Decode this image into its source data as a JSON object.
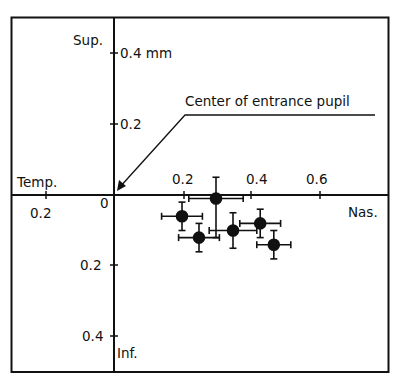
{
  "chart_data": {
    "type": "scatter",
    "title": "",
    "xlabel": "Temp. / Nas.",
    "ylabel": "Sup. / Inf.",
    "units": "mm",
    "x_axis": {
      "negative_label": "Temp.",
      "positive_label": "Nas.",
      "ticks": [
        {
          "value": -0.2,
          "label": "0.2"
        },
        {
          "value": 0.0,
          "label": "0"
        },
        {
          "value": 0.2,
          "label": "0.2"
        },
        {
          "value": 0.4,
          "label": "0.4"
        },
        {
          "value": 0.6,
          "label": "0.6"
        }
      ],
      "range": [
        -0.3,
        0.81
      ]
    },
    "y_axis": {
      "positive_label": "Sup.",
      "negative_label": "Inf.",
      "ticks": [
        {
          "value": 0.4,
          "label": "0.4 mm"
        },
        {
          "value": 0.2,
          "label": "0.2"
        },
        {
          "value": -0.2,
          "label": "0.2"
        },
        {
          "value": -0.4,
          "label": "0.4"
        }
      ],
      "range": [
        -0.5,
        0.5
      ]
    },
    "annotation": {
      "text": "Center of entrance pupil",
      "points_to": [
        0,
        0
      ]
    },
    "grid": false,
    "legend": null,
    "series": [
      {
        "name": "measurements",
        "marker": "filled-circle",
        "points": [
          {
            "x": 0.3,
            "y": -0.01,
            "x_err": [
              0.22,
              0.38
            ],
            "y_err": [
              -0.12,
              0.05
            ]
          },
          {
            "x": 0.2,
            "y": -0.06,
            "x_err": [
              0.14,
              0.26
            ],
            "y_err": [
              -0.1,
              -0.02
            ]
          },
          {
            "x": 0.25,
            "y": -0.12,
            "x_err": [
              0.19,
              0.31
            ],
            "y_err": [
              -0.16,
              -0.08
            ]
          },
          {
            "x": 0.35,
            "y": -0.1,
            "x_err": [
              0.28,
              0.42
            ],
            "y_err": [
              -0.15,
              -0.05
            ]
          },
          {
            "x": 0.43,
            "y": -0.08,
            "x_err": [
              0.37,
              0.49
            ],
            "y_err": [
              -0.12,
              -0.04
            ]
          },
          {
            "x": 0.47,
            "y": -0.14,
            "x_err": [
              0.42,
              0.52
            ],
            "y_err": [
              -0.18,
              -0.1
            ]
          }
        ]
      }
    ]
  },
  "labels": {
    "sup": "Sup.",
    "inf": "Inf.",
    "temp": "Temp.",
    "nas": "Nas.",
    "y_top": "0.4 mm",
    "y_up_02": "0.2",
    "y_down_02": "0.2",
    "y_down_04": "0.4",
    "x_left_02": "0.2",
    "x_zero": "0",
    "x_02": "0.2",
    "x_04": "0.4",
    "x_06": "0.6",
    "annotation": "Center of entrance pupil"
  }
}
